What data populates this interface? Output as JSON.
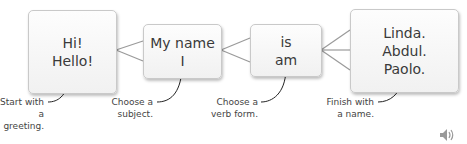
{
  "boxes": [
    {
      "lines": [
        "Hi!",
        "Hello!"
      ]
    },
    {
      "lines": [
        "My name",
        "I"
      ]
    },
    {
      "lines": [
        "is",
        "am"
      ]
    },
    {
      "lines": [
        "Linda.",
        "Abdul.",
        "Paolo."
      ]
    }
  ],
  "captions": [
    {
      "line1": "Start with",
      "line2": "a greeting."
    },
    {
      "line1": "Choose a",
      "line2": "subject."
    },
    {
      "line1": "Choose a",
      "line2": "verb form."
    },
    {
      "line1": "Finish with",
      "line2": "a name."
    }
  ],
  "audio": {
    "icon": "speaker-icon"
  }
}
